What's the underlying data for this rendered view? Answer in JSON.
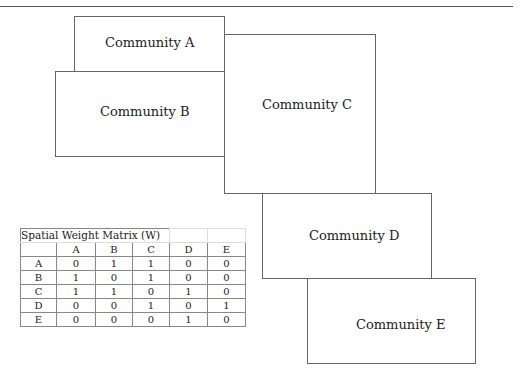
{
  "diagram": {
    "communities": [
      {
        "id": "A",
        "label": "Community A"
      },
      {
        "id": "B",
        "label": "Community B"
      },
      {
        "id": "C",
        "label": "Community C"
      },
      {
        "id": "D",
        "label": "Community D"
      },
      {
        "id": "E",
        "label": "Community E"
      }
    ],
    "matrix": {
      "title": "Spatial Weight Matrix (W)",
      "columns": [
        "",
        "A",
        "B",
        "C",
        "D",
        "E"
      ],
      "rows": [
        {
          "label": "A",
          "values": [
            "0",
            "1",
            "1",
            "0",
            "0"
          ]
        },
        {
          "label": "B",
          "values": [
            "1",
            "0",
            "1",
            "0",
            "0"
          ]
        },
        {
          "label": "C",
          "values": [
            "1",
            "1",
            "0",
            "1",
            "0"
          ]
        },
        {
          "label": "D",
          "values": [
            "0",
            "0",
            "1",
            "0",
            "1"
          ]
        },
        {
          "label": "E",
          "values": [
            "0",
            "0",
            "0",
            "1",
            "0"
          ]
        }
      ]
    }
  }
}
